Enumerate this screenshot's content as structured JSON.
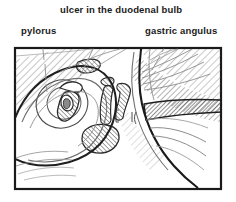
{
  "figure": {
    "type": "medical-illustration",
    "frame": {
      "x": 14,
      "y": 47,
      "width": 208,
      "height": 143,
      "border_color": "#1a1a1a",
      "fill": "#ffffff"
    }
  },
  "labels": {
    "ulcer": "ulcer in the duodenal bulb",
    "pylorus": "pylorus",
    "angulus": "gastric angulus"
  },
  "colors": {
    "ink": "#1a1a1a",
    "line": "#3a3a3a",
    "light_line": "#8d8d8d",
    "hatch": "#6b6b6b",
    "background": "#ffffff"
  },
  "leaders": [
    {
      "name": "pylorus-leader",
      "from": [
        42,
        37
      ],
      "to": [
        46,
        86
      ]
    },
    {
      "name": "ulcer-leader",
      "from": [
        106,
        17
      ],
      "to": [
        78,
        75
      ]
    },
    {
      "name": "angulus-leader",
      "from": [
        168,
        37
      ],
      "to": [
        150,
        70
      ]
    }
  ]
}
